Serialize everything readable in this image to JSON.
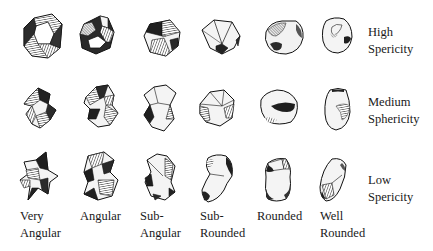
{
  "colors": {
    "ink": "#1a1a1a",
    "paper": "#ffffff",
    "light_face": "#f2f2f2",
    "mid_face": "#9a9a9a",
    "dark_face": "#2b2b2b"
  },
  "rows": [
    {
      "id": "high",
      "label_line1": "High",
      "label_line2": "Spericity",
      "top": 18
    },
    {
      "id": "medium",
      "label_line1": "Medium",
      "label_line2": "Sphericity",
      "top": 103
    },
    {
      "id": "low",
      "label_line1": "Low",
      "label_line2": "Spericity",
      "top": 180
    }
  ],
  "columns": [
    {
      "id": "very-angular",
      "label_line1": "Very",
      "label_line2": "Angular",
      "left": 20
    },
    {
      "id": "angular",
      "label_line1": "Angular",
      "label_line2": "",
      "left": 80
    },
    {
      "id": "sub-angular",
      "label_line1": "Sub-",
      "label_line2": "Angular",
      "left": 140
    },
    {
      "id": "sub-rounded",
      "label_line1": "Sub-",
      "label_line2": "Rounded",
      "left": 200
    },
    {
      "id": "rounded",
      "label_line1": "Rounded",
      "label_line2": "",
      "left": 257
    },
    {
      "id": "well-rounded",
      "label_line1": "Well",
      "label_line2": "Rounded",
      "left": 320
    }
  ],
  "row_label_tops": [
    24,
    94,
    172
  ],
  "grains": [
    {
      "row": 0,
      "col": 0,
      "x": 22,
      "y": 12,
      "w": 42,
      "h": 48,
      "type": "angular-ring"
    },
    {
      "row": 0,
      "col": 1,
      "x": 78,
      "y": 14,
      "w": 38,
      "h": 42,
      "type": "angular-dark"
    },
    {
      "row": 0,
      "col": 2,
      "x": 142,
      "y": 18,
      "w": 40,
      "h": 40,
      "type": "subangular"
    },
    {
      "row": 0,
      "col": 3,
      "x": 200,
      "y": 18,
      "w": 44,
      "h": 38,
      "type": "subrounded"
    },
    {
      "row": 0,
      "col": 4,
      "x": 262,
      "y": 18,
      "w": 44,
      "h": 38,
      "type": "rounded"
    },
    {
      "row": 0,
      "col": 5,
      "x": 320,
      "y": 15,
      "w": 34,
      "h": 40,
      "type": "well-rounded"
    },
    {
      "row": 1,
      "col": 0,
      "x": 22,
      "y": 86,
      "w": 36,
      "h": 44,
      "type": "very-angular-twist"
    },
    {
      "row": 1,
      "col": 1,
      "x": 82,
      "y": 83,
      "w": 38,
      "h": 46,
      "type": "angular-twist"
    },
    {
      "row": 1,
      "col": 2,
      "x": 140,
      "y": 83,
      "w": 38,
      "h": 50,
      "type": "subangular-tall"
    },
    {
      "row": 1,
      "col": 3,
      "x": 198,
      "y": 88,
      "w": 38,
      "h": 40,
      "type": "subrounded-med"
    },
    {
      "row": 1,
      "col": 4,
      "x": 257,
      "y": 88,
      "w": 42,
      "h": 40,
      "type": "rounded-med"
    },
    {
      "row": 1,
      "col": 5,
      "x": 322,
      "y": 86,
      "w": 30,
      "h": 46,
      "type": "well-rounded-med"
    },
    {
      "row": 2,
      "col": 0,
      "x": 18,
      "y": 150,
      "w": 44,
      "h": 52,
      "type": "very-angular-star"
    },
    {
      "row": 2,
      "col": 1,
      "x": 80,
      "y": 150,
      "w": 40,
      "h": 52,
      "type": "angular-low"
    },
    {
      "row": 2,
      "col": 2,
      "x": 143,
      "y": 152,
      "w": 34,
      "h": 50,
      "type": "subangular-low"
    },
    {
      "row": 2,
      "col": 3,
      "x": 200,
      "y": 152,
      "w": 36,
      "h": 52,
      "type": "subrounded-low"
    },
    {
      "row": 2,
      "col": 4,
      "x": 262,
      "y": 155,
      "w": 32,
      "h": 48,
      "type": "rounded-low"
    },
    {
      "row": 2,
      "col": 5,
      "x": 318,
      "y": 157,
      "w": 30,
      "h": 46,
      "type": "well-rounded-low"
    }
  ]
}
